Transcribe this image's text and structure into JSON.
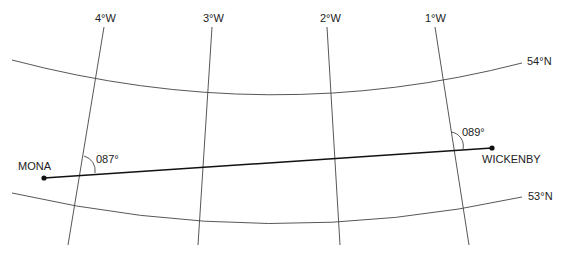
{
  "diagram": {
    "type": "navigation-chart-great-circle",
    "meridians": [
      {
        "label": "4°W"
      },
      {
        "label": "3°W"
      },
      {
        "label": "2°W"
      },
      {
        "label": "1°W"
      }
    ],
    "parallels": [
      {
        "label": "54°N"
      },
      {
        "label": "53°N"
      }
    ],
    "points": {
      "start": {
        "name": "MONA"
      },
      "end": {
        "name": "WICKENBY"
      }
    },
    "angles": {
      "start_track": "087°",
      "end_track": "089°"
    },
    "colors": {
      "grid_line": "#444444",
      "route_line": "#111111",
      "text": "#222222"
    }
  }
}
